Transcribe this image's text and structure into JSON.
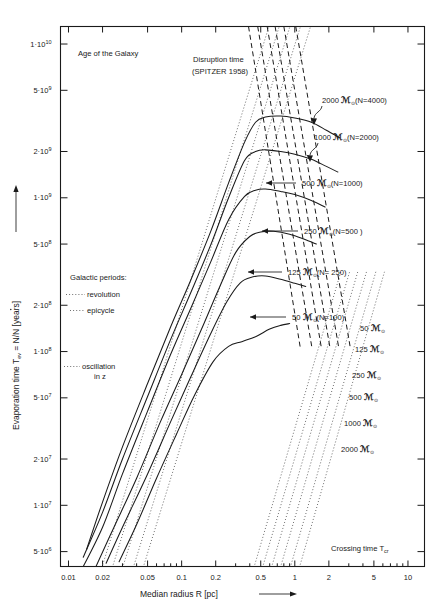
{
  "figure": {
    "title_note": "Age of the Galaxy",
    "disruption_note_line1": "Disruption time",
    "disruption_note_line2": "(SPITZER 1958)",
    "crossing_note": "Crossing time T",
    "crossing_note_sub": "cr",
    "legend_heading": "Galactic periods:",
    "legend_item_revolution": "revolution",
    "legend_item_epicycle": "epicycle",
    "legend_item_oscillation_line1": "oscillation",
    "legend_item_oscillation_line2": "in z"
  },
  "axes": {
    "x_title_main": "Median  radius  R [pc]",
    "y_title_main": "Evaporation time  T",
    "y_title_sub": "ev",
    "y_title_rest": " = N/N [years]",
    "x_ticklabels": [
      "0.01",
      "0.02",
      "0.05",
      "0.1",
      "0.2",
      "0.5",
      "1",
      "2",
      "5",
      "10"
    ],
    "x_tickvalues": [
      0.01,
      0.02,
      0.05,
      0.1,
      0.2,
      0.5,
      1,
      2,
      5,
      10
    ],
    "y_ticklabels": [
      "1·10",
      "5·10",
      "2·10",
      "1·10",
      "5·10",
      "2·10",
      "1·10",
      "5·10",
      "2·10",
      "1·10",
      "5·10"
    ],
    "y_tickexponents": [
      "10",
      "9",
      "9",
      "9",
      "8",
      "8",
      "8",
      "7",
      "7",
      "7",
      "6"
    ],
    "y_tickvalues": [
      10000000000.0,
      5000000000.0,
      2000000000.0,
      1000000000.0,
      500000000.0,
      200000000.0,
      100000000.0,
      50000000.0,
      20000000.0,
      10000000.0,
      5000000.0
    ],
    "x_range": [
      0.0085,
      14
    ],
    "y_range": [
      4000000,
      13000000000
    ]
  },
  "chart_data": {
    "type": "line",
    "xlabel": "Median radius R [pc]",
    "ylabel": "Evaporation time T_ev = N/Ṅ [years]",
    "xscale": "log",
    "yscale": "log",
    "xlim": [
      0.0085,
      14
    ],
    "ylim": [
      4000000,
      13000000000
    ],
    "grid": false,
    "legend_position": "inline-annotations",
    "series": [
      {
        "name": "2000 𝔐⊙ (N=4000)",
        "label": "2000",
        "label_suffix": "(N=4000)",
        "style": "solid",
        "group": "evaporation",
        "points": [
          [
            0.0145,
            5200000.0
          ],
          [
            0.02,
            10500000.0
          ],
          [
            0.03,
            24000000.0
          ],
          [
            0.05,
            62000000.0
          ],
          [
            0.08,
            145000000.0
          ],
          [
            0.12,
            290000000.0
          ],
          [
            0.18,
            600000000.0
          ],
          [
            0.26,
            1250000000.0
          ],
          [
            0.36,
            2300000000.0
          ],
          [
            0.45,
            3100000000.0
          ],
          [
            0.55,
            3350000000.0
          ],
          [
            0.75,
            3400000000.0
          ],
          [
            1.0,
            3300000000.0
          ],
          [
            1.4,
            3100000000.0
          ],
          [
            1.9,
            2750000000.0
          ],
          [
            2.5,
            2450000000.0
          ]
        ]
      },
      {
        "name": "1000 𝔐⊙ (N=2000)",
        "label": "1000",
        "label_suffix": "(N=2000)",
        "style": "solid",
        "group": "evaporation",
        "points": [
          [
            0.0135,
            4600000.0
          ],
          [
            0.02,
            9000000.0
          ],
          [
            0.03,
            20000000.0
          ],
          [
            0.05,
            51000000.0
          ],
          [
            0.08,
            120000000.0
          ],
          [
            0.12,
            240000000.0
          ],
          [
            0.18,
            490000000.0
          ],
          [
            0.26,
            1000000000.0
          ],
          [
            0.36,
            1750000000.0
          ],
          [
            0.45,
            2000000000.0
          ],
          [
            0.55,
            2050000000.0
          ],
          [
            0.75,
            2000000000.0
          ],
          [
            1.0,
            1920000000.0
          ],
          [
            1.4,
            1780000000.0
          ],
          [
            1.9,
            1600000000.0
          ],
          [
            2.4,
            1470000000.0
          ]
        ]
      },
      {
        "name": "500 𝔐⊙ (N=1000)",
        "label": "500",
        "label_suffix": "(N=1000)",
        "style": "solid",
        "group": "evaporation",
        "points": [
          [
            0.0128,
            3700000.0
          ],
          [
            0.02,
            7200000.0
          ],
          [
            0.03,
            16000000.0
          ],
          [
            0.05,
            41000000.0
          ],
          [
            0.08,
            96000000.0
          ],
          [
            0.12,
            190000000.0
          ],
          [
            0.18,
            380000000.0
          ],
          [
            0.26,
            720000000.0
          ],
          [
            0.36,
            1020000000.0
          ],
          [
            0.45,
            1120000000.0
          ],
          [
            0.55,
            1140000000.0
          ],
          [
            0.75,
            1100000000.0
          ],
          [
            1.0,
            1050000000.0
          ],
          [
            1.4,
            960000000.0
          ],
          [
            1.85,
            870000000.0
          ]
        ]
      },
      {
        "name": "250 𝔐⊙ (N=500)",
        "label": "250",
        "label_suffix": "(N=500 )",
        "style": "solid",
        "group": "evaporation",
        "points": [
          [
            0.0175,
            4000000.0
          ],
          [
            0.025,
            7100000.0
          ],
          [
            0.04,
            15000000.0
          ],
          [
            0.065,
            35000000.0
          ],
          [
            0.1,
            71000000.0
          ],
          [
            0.15,
            140000000.0
          ],
          [
            0.22,
            270000000.0
          ],
          [
            0.3,
            440000000.0
          ],
          [
            0.4,
            560000000.0
          ],
          [
            0.5,
            600000000.0
          ],
          [
            0.65,
            605000000.0
          ],
          [
            0.9,
            580000000.0
          ],
          [
            1.2,
            540000000.0
          ],
          [
            1.55,
            500000000.0
          ]
        ]
      },
      {
        "name": "125 𝔐⊙ (N=250)",
        "label": "125",
        "label_suffix": "(N= 250)",
        "style": "solid",
        "group": "evaporation",
        "points": [
          [
            0.0215,
            4200000.0
          ],
          [
            0.03,
            7200000.0
          ],
          [
            0.05,
            16000000.0
          ],
          [
            0.08,
            35000000.0
          ],
          [
            0.12,
            68000000.0
          ],
          [
            0.18,
            130000000.0
          ],
          [
            0.25,
            210000000.0
          ],
          [
            0.33,
            280000000.0
          ],
          [
            0.42,
            305000000.0
          ],
          [
            0.55,
            310000000.0
          ],
          [
            0.75,
            295000000.0
          ],
          [
            1.0,
            278000000.0
          ],
          [
            1.25,
            265000000.0
          ]
        ]
      },
      {
        "name": "50 𝔐⊙ (N=100)",
        "label": "50",
        "label_suffix": "(N=100)",
        "style": "solid",
        "group": "evaporation",
        "points": [
          [
            0.028,
            4300000.0
          ],
          [
            0.04,
            7500000.0
          ],
          [
            0.06,
            15000000.0
          ],
          [
            0.09,
            29000000.0
          ],
          [
            0.13,
            52000000.0
          ],
          [
            0.19,
            86000000.0
          ],
          [
            0.26,
            108000000.0
          ],
          [
            0.34,
            116000000.0
          ],
          [
            0.45,
            125000000.0
          ],
          [
            0.6,
            140000000.0
          ],
          [
            0.75,
            148000000.0
          ],
          [
            0.9,
            152000000.0
          ]
        ]
      }
    ],
    "disruption_lines": {
      "note": "Disruption time (SPITZER 1958) — dashed lines, one per mass",
      "style": "dashed",
      "labels": [
        "50 𝔐⊙",
        "125 𝔐⊙",
        "250 𝔐⊙",
        "500 𝔐⊙",
        "1000 𝔐⊙",
        "2000 𝔐⊙"
      ],
      "lines": [
        {
          "mass": 2000,
          "x_top": 0.39,
          "y_top": 13000000000.0,
          "x_bot": 1.12,
          "y_bot": 105000000.0
        },
        {
          "mass": 1000,
          "x_top": 0.47,
          "y_top": 13000000000.0,
          "x_bot": 1.42,
          "y_bot": 105000000.0
        },
        {
          "mass": 500,
          "x_top": 0.57,
          "y_top": 13000000000.0,
          "x_bot": 1.72,
          "y_bot": 105000000.0
        },
        {
          "mass": 250,
          "x_top": 0.67,
          "y_top": 13000000000.0,
          "x_bot": 2.05,
          "y_bot": 105000000.0
        },
        {
          "mass": 125,
          "x_top": 0.8,
          "y_top": 13000000000.0,
          "x_bot": 2.45,
          "y_bot": 105000000.0
        },
        {
          "mass": 50,
          "x_top": 1.02,
          "y_top": 13000000000.0,
          "x_bot": 3.1,
          "y_bot": 105000000.0
        }
      ]
    },
    "crossing_lines": {
      "note": "Crossing time T_cr — dotted lines, one per mass",
      "style": "dotted",
      "labels_right": [
        "50 𝔐⊙",
        "125 𝔐⊙",
        "250 𝔐⊙",
        "500 𝔐⊙",
        "1000 𝔐⊙",
        "2000 𝔐⊙"
      ],
      "lines": [
        {
          "mass": 50,
          "x_bot": 0.42,
          "x_top": 2.55
        },
        {
          "mass": 125,
          "x_bot": 0.5,
          "x_top": 3.05
        },
        {
          "mass": 250,
          "x_bot": 0.6,
          "x_top": 3.6
        },
        {
          "mass": 500,
          "x_bot": 0.72,
          "x_top": 4.3
        },
        {
          "mass": 1000,
          "x_bot": 0.88,
          "x_top": 5.2
        },
        {
          "mass": 2000,
          "x_bot": 1.06,
          "x_top": 6.2
        }
      ]
    },
    "galactic_period_lines": {
      "note": "Galactic periods — dotted, left side: revolution, epicycle, oscillation in z",
      "style": "dotted",
      "entries": [
        "revolution",
        "epicycle",
        "oscillation in z"
      ]
    }
  },
  "annotations": {
    "right_mass_labels": [
      "50",
      "125",
      "250",
      "500",
      "1000",
      "2000"
    ],
    "solar_mass_symbol": "𝔐",
    "solar_subscript": "⊙",
    "curve_callouts": [
      {
        "mass": "2000",
        "paren": "(N=4000)",
        "arrow": "hook"
      },
      {
        "mass": "1000",
        "paren": "(N=2000)",
        "arrow": "hook"
      },
      {
        "mass": "500",
        "paren": "(N=1000 )",
        "arrow": "left"
      },
      {
        "mass": "250",
        "paren": "(N=500 )",
        "arrow": "left"
      },
      {
        "mass": "125",
        "paren": "(N= 250)",
        "arrow": "left"
      },
      {
        "mass": "50",
        "paren": "(N=100)",
        "arrow": "left"
      }
    ]
  }
}
